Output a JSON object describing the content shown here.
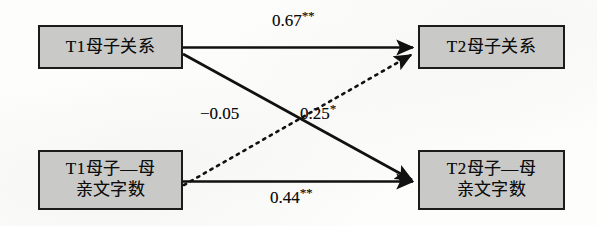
{
  "figure": {
    "type": "cross-lagged-path-diagram",
    "nodes": [
      {
        "id": "t1-relation",
        "label": "T1母子关系"
      },
      {
        "id": "t2-relation",
        "label": "T2母子关系"
      },
      {
        "id": "t1-words",
        "label": "T1母子—母\n亲文字数"
      },
      {
        "id": "t2-words",
        "label": "T2母子—母\n亲文字数"
      }
    ],
    "paths": [
      {
        "id": "autoregressive-relation",
        "from": "t1-relation",
        "to": "t2-relation",
        "coefficient": "0.67",
        "significance": "**",
        "style": "solid"
      },
      {
        "id": "cross-relation-to-words",
        "from": "t1-relation",
        "to": "t2-words",
        "coefficient": "−0.05",
        "significance": "",
        "style": "solid"
      },
      {
        "id": "cross-words-to-relation",
        "from": "t1-words",
        "to": "t2-relation",
        "coefficient": "0.25",
        "significance": "*",
        "style": "dotted"
      },
      {
        "id": "autoregressive-words",
        "from": "t1-words",
        "to": "t2-words",
        "coefficient": "0.44",
        "significance": "**",
        "style": "solid"
      }
    ],
    "colors": {
      "node_fill": "#c9c9c7",
      "node_border": "#1b1b1b",
      "line": "#111111",
      "text": "#0d0d0d",
      "background": "#fdfdfc"
    }
  }
}
